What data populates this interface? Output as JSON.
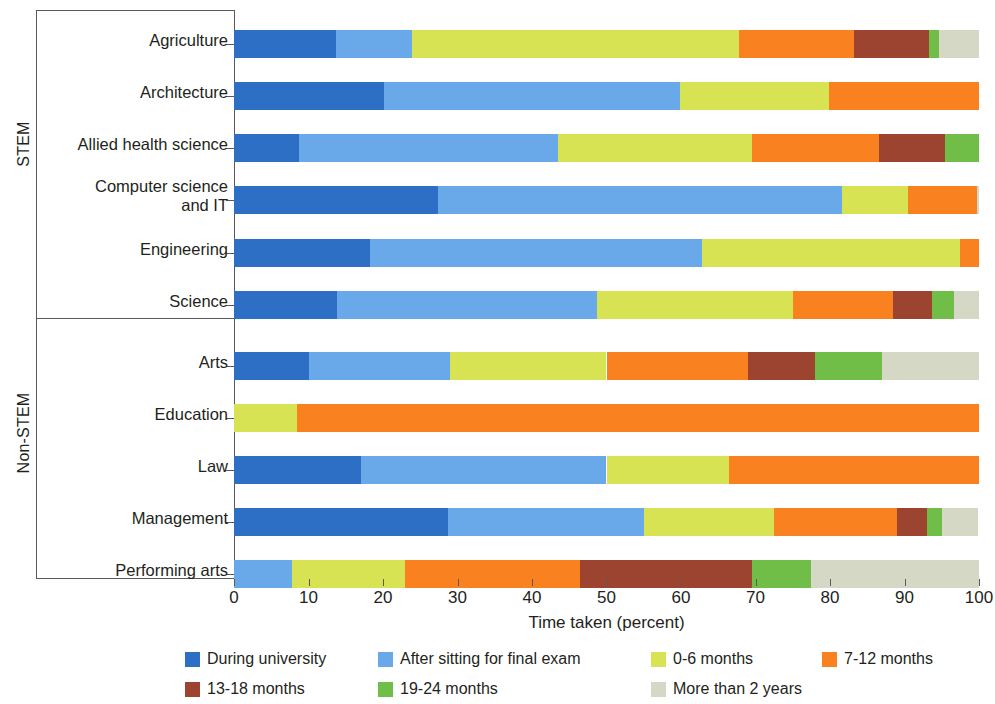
{
  "axis": {
    "x_title": "Time taken (percent)",
    "x_ticks": [
      "0",
      "10",
      "20",
      "30",
      "40",
      "50",
      "60",
      "70",
      "80",
      "90",
      "100"
    ],
    "x_min": 0,
    "x_max": 100
  },
  "groups": [
    {
      "label": "STEM",
      "name": "group-stem"
    },
    {
      "label": "Non-STEM",
      "name": "group-non-stem"
    }
  ],
  "legend": {
    "items": [
      {
        "label": "During university",
        "color": "#2d6fc4"
      },
      {
        "label": "After sitting for final exam",
        "color": "#6aa9e9"
      },
      {
        "label": "0-6 months",
        "color": "#d7e352"
      },
      {
        "label": "7-12 months",
        "color": "#f9811f"
      },
      {
        "label": "13-18 months",
        "color": "#9c4430"
      },
      {
        "label": "19-24 months",
        "color": "#70bd48"
      },
      {
        "label": "More than 2 years",
        "color": "#d5d8c4"
      }
    ]
  },
  "chart_data": {
    "type": "bar",
    "orientation": "horizontal",
    "stacked": true,
    "title": "",
    "xlabel": "Time taken (percent)",
    "ylabel": "",
    "xlim": [
      0,
      100
    ],
    "grid": false,
    "legend_position": "bottom",
    "series": [
      {
        "name": "During university",
        "color": "#2d6fc4",
        "values": [
          13.7,
          20.1,
          8.7,
          27.4,
          18.3,
          13.8,
          10.0,
          0.0,
          17.0,
          28.7,
          0.0
        ]
      },
      {
        "name": "After sitting for final exam",
        "color": "#6aa9e9",
        "values": [
          10.2,
          39.8,
          34.8,
          54.2,
          44.5,
          34.9,
          19.0,
          0.0,
          33.0,
          26.3,
          7.8
        ]
      },
      {
        "name": "0-6 months",
        "color": "#d7e352",
        "values": [
          43.9,
          20.0,
          26.0,
          8.9,
          34.6,
          26.3,
          21.0,
          8.5,
          16.5,
          17.5,
          15.2
        ]
      },
      {
        "name": "7-12 months",
        "color": "#f9811f",
        "values": [
          15.4,
          20.1,
          17.1,
          9.2,
          2.6,
          13.5,
          19.0,
          91.5,
          33.5,
          16.5,
          23.5
        ]
      },
      {
        "name": "13-18 months",
        "color": "#9c4430",
        "values": [
          10.1,
          0.0,
          8.8,
          0.0,
          0.0,
          5.2,
          9.0,
          0.0,
          0.0,
          4.0,
          23.0
        ]
      },
      {
        "name": "19-24 months",
        "color": "#70bd48",
        "values": [
          1.3,
          0.0,
          4.6,
          0.0,
          0.0,
          3.0,
          9.0,
          0.0,
          0.0,
          2.0,
          8.0
        ]
      },
      {
        "name": "More than 2 years",
        "color": "#d5d8c4",
        "values": [
          5.4,
          0.0,
          0.0,
          0.3,
          0.0,
          3.3,
          13.0,
          0.0,
          0.0,
          4.8,
          22.5
        ]
      }
    ],
    "categories": [
      "Agriculture",
      "Architecture",
      "Allied health science",
      "Computer science and IT",
      "Engineering",
      "Science",
      "Arts",
      "Education",
      "Law",
      "Management",
      "Performing arts"
    ]
  },
  "rows": [
    {
      "label": "Agriculture",
      "group": "STEM",
      "label_lines": [
        "Agriculture"
      ],
      "segments": [
        {
          "c": "#2d6fc4",
          "v": 13.7
        },
        {
          "c": "#6aa9e9",
          "v": 10.2
        },
        {
          "c": "#d7e352",
          "v": 43.9
        },
        {
          "c": "#f9811f",
          "v": 15.4
        },
        {
          "c": "#9c4430",
          "v": 10.1
        },
        {
          "c": "#70bd48",
          "v": 1.3
        },
        {
          "c": "#d5d8c4",
          "v": 5.4
        }
      ]
    },
    {
      "label": "Architecture",
      "group": "STEM",
      "label_lines": [
        "Architecture"
      ],
      "segments": [
        {
          "c": "#2d6fc4",
          "v": 20.1
        },
        {
          "c": "#6aa9e9",
          "v": 39.8
        },
        {
          "c": "#d7e352",
          "v": 20.0
        },
        {
          "c": "#f9811f",
          "v": 20.1
        }
      ]
    },
    {
      "label": "Allied health science",
      "group": "STEM",
      "label_lines": [
        "Allied health science"
      ],
      "segments": [
        {
          "c": "#2d6fc4",
          "v": 8.7
        },
        {
          "c": "#6aa9e9",
          "v": 34.8
        },
        {
          "c": "#d7e352",
          "v": 26.0
        },
        {
          "c": "#f9811f",
          "v": 17.1
        },
        {
          "c": "#9c4430",
          "v": 8.8
        },
        {
          "c": "#70bd48",
          "v": 4.6
        }
      ]
    },
    {
      "label": "Computer science and IT",
      "group": "STEM",
      "label_lines": [
        "Computer science",
        "and IT"
      ],
      "segments": [
        {
          "c": "#2d6fc4",
          "v": 27.4
        },
        {
          "c": "#6aa9e9",
          "v": 54.2
        },
        {
          "c": "#d7e352",
          "v": 8.9
        },
        {
          "c": "#f9811f",
          "v": 9.2
        },
        {
          "c": "#d5d8c4",
          "v": 0.3
        }
      ]
    },
    {
      "label": "Engineering",
      "group": "STEM",
      "label_lines": [
        "Engineering"
      ],
      "segments": [
        {
          "c": "#2d6fc4",
          "v": 18.3
        },
        {
          "c": "#6aa9e9",
          "v": 44.5
        },
        {
          "c": "#d7e352",
          "v": 34.6
        },
        {
          "c": "#f9811f",
          "v": 2.6
        }
      ]
    },
    {
      "label": "Science",
      "group": "STEM",
      "label_lines": [
        "Science"
      ],
      "segments": [
        {
          "c": "#2d6fc4",
          "v": 13.8
        },
        {
          "c": "#6aa9e9",
          "v": 34.9
        },
        {
          "c": "#d7e352",
          "v": 26.3
        },
        {
          "c": "#f9811f",
          "v": 13.5
        },
        {
          "c": "#9c4430",
          "v": 5.2
        },
        {
          "c": "#70bd48",
          "v": 3.0
        },
        {
          "c": "#d5d8c4",
          "v": 3.3
        }
      ]
    },
    {
      "label": "Arts",
      "group": "Non-STEM",
      "label_lines": [
        "Arts"
      ],
      "segments": [
        {
          "c": "#2d6fc4",
          "v": 10.0
        },
        {
          "c": "#6aa9e9",
          "v": 19.0
        },
        {
          "c": "#d7e352",
          "v": 21.0
        },
        {
          "c": "#f9811f",
          "v": 19.0
        },
        {
          "c": "#9c4430",
          "v": 9.0
        },
        {
          "c": "#70bd48",
          "v": 9.0
        },
        {
          "c": "#d5d8c4",
          "v": 13.0
        }
      ]
    },
    {
      "label": "Education",
      "group": "Non-STEM",
      "label_lines": [
        "Education"
      ],
      "segments": [
        {
          "c": "#d7e352",
          "v": 8.5
        },
        {
          "c": "#f9811f",
          "v": 91.5
        }
      ]
    },
    {
      "label": "Law",
      "group": "Non-STEM",
      "label_lines": [
        "Law"
      ],
      "segments": [
        {
          "c": "#2d6fc4",
          "v": 17.0
        },
        {
          "c": "#6aa9e9",
          "v": 33.0
        },
        {
          "c": "#d7e352",
          "v": 16.5
        },
        {
          "c": "#f9811f",
          "v": 33.5
        }
      ]
    },
    {
      "label": "Management",
      "group": "Non-STEM",
      "label_lines": [
        "Management"
      ],
      "segments": [
        {
          "c": "#2d6fc4",
          "v": 28.7
        },
        {
          "c": "#6aa9e9",
          "v": 26.3
        },
        {
          "c": "#d7e352",
          "v": 17.5
        },
        {
          "c": "#f9811f",
          "v": 16.5
        },
        {
          "c": "#9c4430",
          "v": 4.0
        },
        {
          "c": "#70bd48",
          "v": 2.0
        },
        {
          "c": "#d5d8c4",
          "v": 4.8
        }
      ]
    },
    {
      "label": "Performing arts",
      "group": "Non-STEM",
      "label_lines": [
        "Performing arts"
      ],
      "segments": [
        {
          "c": "#6aa9e9",
          "v": 7.8
        },
        {
          "c": "#d7e352",
          "v": 15.2
        },
        {
          "c": "#f9811f",
          "v": 23.5
        },
        {
          "c": "#9c4430",
          "v": 23.0
        },
        {
          "c": "#70bd48",
          "v": 8.0
        },
        {
          "c": "#d5d8c4",
          "v": 22.5
        }
      ]
    }
  ]
}
